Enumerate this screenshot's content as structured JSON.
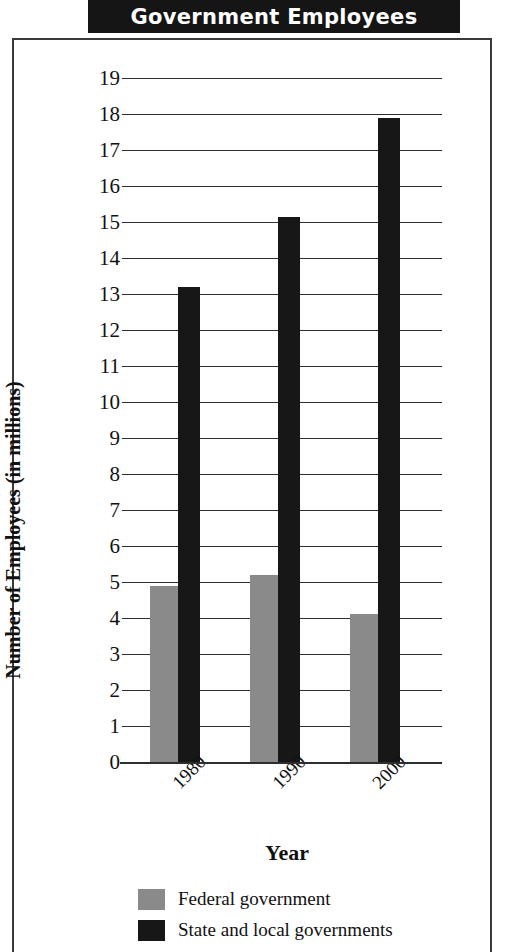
{
  "title": "Government Employees",
  "chart_data": {
    "type": "bar",
    "title": "Government Employees",
    "xlabel": "Year",
    "ylabel": "Number of Employees (in millions)",
    "categories": [
      "1980",
      "1990",
      "2000"
    ],
    "series": [
      {
        "name": "Federal government",
        "color": "#8a8a8a",
        "values": [
          4.9,
          5.2,
          4.1
        ]
      },
      {
        "name": "State and local governments",
        "color": "#171717",
        "values": [
          13.2,
          15.15,
          17.9
        ]
      }
    ],
    "ylim": [
      0,
      19
    ],
    "ytick_labels": [
      "19",
      "18",
      "17",
      "16",
      "15",
      "14",
      "13",
      "12",
      "11",
      "10",
      "9",
      "8",
      "7",
      "6",
      "5",
      "4",
      "3",
      "2",
      "1",
      "0"
    ],
    "ytick_values": [
      19,
      18,
      17,
      16,
      15,
      14,
      13,
      12,
      11,
      10,
      9,
      8,
      7,
      6,
      5,
      4,
      3,
      2,
      1,
      0
    ],
    "grid": true,
    "legend_position": "bottom-left",
    "xtick_rotation": -45
  }
}
